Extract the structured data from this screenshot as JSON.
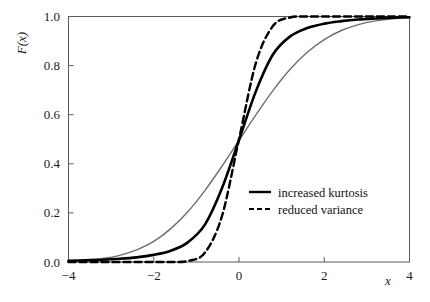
{
  "chart_data": {
    "type": "line",
    "title": "",
    "xlabel": "x",
    "ylabel": "F(x)",
    "xlim": [
      -4,
      4
    ],
    "ylim": [
      0,
      1
    ],
    "grid": false,
    "legend_position": "center-right",
    "x_ticks": [
      "-4",
      "-2",
      "0",
      "2",
      "4"
    ],
    "x_tick_values": [
      -4,
      -2,
      0,
      2,
      4
    ],
    "y_ticks": [
      "0.0",
      "0.2",
      "0.4",
      "0.6",
      "0.8",
      "1.0"
    ],
    "y_tick_values": [
      0.0,
      0.2,
      0.4,
      0.6,
      0.8,
      1.0
    ],
    "series": [
      {
        "name": "baseline",
        "label": "",
        "in_legend": false,
        "style": "solid",
        "color": "#6e6e6e",
        "width": 1.4,
        "x": [
          -4.0,
          -3.6,
          -3.2,
          -2.8,
          -2.4,
          -2.0,
          -1.6,
          -1.2,
          -0.8,
          -0.4,
          0.0,
          0.4,
          0.8,
          1.2,
          1.6,
          2.0,
          2.4,
          2.8,
          3.2,
          3.6,
          4.0
        ],
        "y": [
          0.003,
          0.007,
          0.014,
          0.027,
          0.049,
          0.084,
          0.136,
          0.205,
          0.291,
          0.39,
          0.495,
          0.6,
          0.699,
          0.785,
          0.854,
          0.906,
          0.943,
          0.967,
          0.982,
          0.991,
          0.996
        ]
      },
      {
        "name": "increased-kurtosis",
        "label": "increased kurtosis",
        "in_legend": true,
        "style": "solid",
        "color": "#000000",
        "width": 2.6,
        "x": [
          -4.0,
          -3.6,
          -3.2,
          -2.8,
          -2.4,
          -2.0,
          -1.6,
          -1.2,
          -0.8,
          -0.4,
          0.0,
          0.4,
          0.8,
          1.2,
          1.6,
          2.0,
          2.4,
          2.8,
          3.2,
          3.6,
          4.0
        ],
        "y": [
          0.005,
          0.007,
          0.009,
          0.013,
          0.019,
          0.029,
          0.046,
          0.08,
          0.152,
          0.3,
          0.497,
          0.697,
          0.846,
          0.919,
          0.953,
          0.971,
          0.981,
          0.988,
          0.992,
          0.995,
          0.997
        ]
      },
      {
        "name": "reduced-variance",
        "label": "reduced variance",
        "in_legend": true,
        "style": "dashed",
        "color": "#000000",
        "width": 2.4,
        "x": [
          -4.0,
          -3.6,
          -3.2,
          -2.8,
          -2.4,
          -2.0,
          -1.6,
          -1.2,
          -0.8,
          -0.4,
          0.0,
          0.4,
          0.8,
          1.2,
          1.6,
          2.0,
          2.4,
          2.8,
          3.2,
          3.6,
          4.0
        ],
        "y": [
          0.0,
          0.0,
          0.0,
          0.0,
          0.0,
          0.0,
          0.0,
          0.004,
          0.038,
          0.187,
          0.5,
          0.813,
          0.962,
          0.996,
          1.0,
          1.0,
          1.0,
          1.0,
          1.0,
          1.0,
          1.0
        ]
      }
    ],
    "legend": [
      {
        "label": "increased kurtosis",
        "style": "solid"
      },
      {
        "label": "reduced variance",
        "style": "dashed"
      }
    ]
  }
}
